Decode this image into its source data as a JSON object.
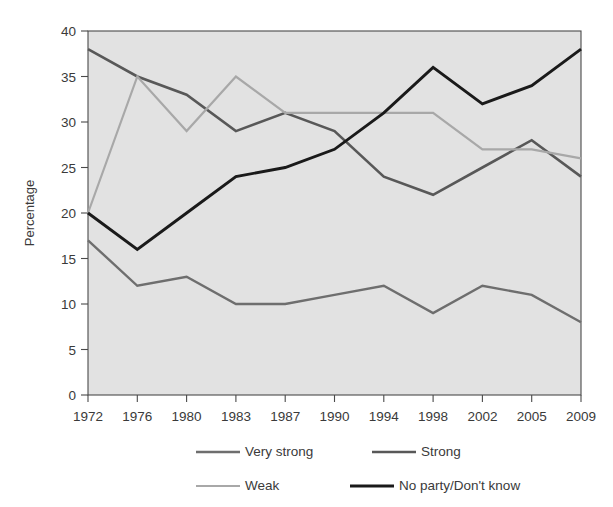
{
  "chart_data": {
    "type": "line",
    "title": "",
    "xlabel": "",
    "ylabel": "Percentage",
    "categories": [
      "1972",
      "1976",
      "1980",
      "1983",
      "1987",
      "1990",
      "1994",
      "1998",
      "2002",
      "2005",
      "2009"
    ],
    "ylim": [
      0,
      40
    ],
    "yticks": [
      0,
      5,
      10,
      15,
      20,
      25,
      30,
      35,
      40
    ],
    "ytick_labels": [
      "0",
      "5",
      "10",
      "15",
      "20",
      "25",
      "30",
      "35",
      "40"
    ],
    "grid": false,
    "legend_position": "bottom",
    "plot_background": "#e2e2e2",
    "series": [
      {
        "name": "Very strong",
        "color": "#6e6e6e",
        "width": 2.4,
        "values": [
          17,
          12,
          13,
          10,
          10,
          11,
          12,
          9,
          12,
          11,
          8
        ]
      },
      {
        "name": "Strong",
        "color": "#585858",
        "width": 2.6,
        "values": [
          38,
          35,
          33,
          29,
          31,
          29,
          24,
          22,
          25,
          28,
          24
        ]
      },
      {
        "name": "Weak",
        "color": "#a8a8a8",
        "width": 2.2,
        "values": [
          20,
          35,
          29,
          35,
          31,
          31,
          31,
          31,
          27,
          27,
          26
        ]
      },
      {
        "name": "No party/Don't know",
        "color": "#1a1a1a",
        "width": 2.9,
        "values": [
          20,
          16,
          20,
          24,
          25,
          27,
          31,
          36,
          32,
          34,
          38
        ]
      }
    ]
  },
  "axes": {
    "y_title": "Percentage"
  },
  "legend": {
    "entries": [
      {
        "label": "Very strong",
        "color": "#6e6e6e"
      },
      {
        "label": "Strong",
        "color": "#585858"
      },
      {
        "label": "Weak",
        "color": "#a8a8a8"
      },
      {
        "label": "No party/Don't know",
        "color": "#1a1a1a"
      }
    ]
  }
}
